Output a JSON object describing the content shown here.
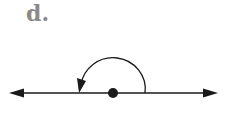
{
  "figure": {
    "label": "d.",
    "colors": {
      "line": "#1a1a1a",
      "label": "#8a8a8a",
      "background": "#ffffff"
    }
  }
}
